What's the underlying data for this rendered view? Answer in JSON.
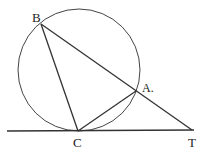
{
  "diagram": {
    "type": "geometry",
    "labels": {
      "B": "B",
      "A": "A.",
      "C": "C",
      "T": "T"
    },
    "points": {
      "B": [
        41,
        24
      ],
      "A": [
        136,
        91
      ],
      "C": [
        78,
        131
      ],
      "T": [
        192,
        130
      ]
    },
    "circle": {
      "cx": 79,
      "cy": 70,
      "r": 61
    },
    "tangent_line": {
      "x1": 7,
      "y1": 131,
      "x2": 194,
      "y2": 130
    },
    "stroke_color": "#333333"
  }
}
